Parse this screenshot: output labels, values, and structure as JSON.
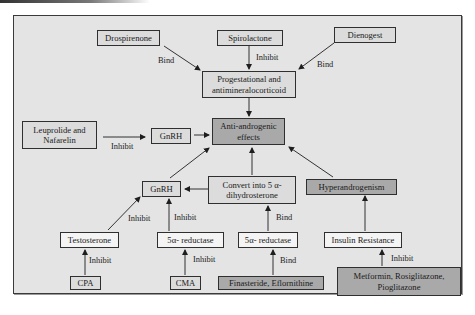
{
  "diagram": {
    "nodes": {
      "drospirenone": "Drospirenone",
      "spirolactone": "Spirolactone",
      "dienogest": "Dienogest",
      "progestational": "Progestational and antimineralocorticoid",
      "leuprolide": "Leuprolide and Nafarelin",
      "gnrh_top": "GnRH",
      "anti_androgenic": "Anti-androgenic effects",
      "gnrh_mid": "GnRH",
      "convert": "Convert into 5 α-dihydrosterone",
      "hyperandrogenism": "Hyperandrogenism",
      "testosterone": "Testosterone",
      "reductase_left": "5α- reductase",
      "reductase_right": "5α- reductase",
      "insulin_resistance": "Insulin Resistance",
      "cpa": "CPA",
      "cma": "CMA",
      "finasteride": "Finasteride, Eflornithine",
      "metformin": "Metformin, Rosiglitazone, Pioglitazone"
    },
    "edge_labels": {
      "drospirenone_bind": "Bind",
      "spirolactone_inhibit": "Inhibit",
      "dienogest_bind": "Bind",
      "leuprolide_inhibit": "Inhibit",
      "testosterone_inhibit": "Inhibit",
      "reductase_left_inhibit": "Inhibit",
      "reductase_right_bind": "Bind",
      "cpa_inhibit": "Inhibit",
      "cma_inhibit": "Inhibit",
      "finasteride_bind": "Bind",
      "metformin_inhibit": "Inhibit"
    },
    "edges": [
      {
        "from": "drospirenone",
        "to": "progestational",
        "label": "Bind"
      },
      {
        "from": "spirolactone",
        "to": "progestational",
        "label": "Inhibit"
      },
      {
        "from": "dienogest",
        "to": "progestational",
        "label": "Bind"
      },
      {
        "from": "progestational",
        "to": "anti_androgenic",
        "label": ""
      },
      {
        "from": "leuprolide",
        "to": "gnrh_top",
        "label": "Inhibit"
      },
      {
        "from": "gnrh_top",
        "to": "anti_androgenic",
        "label": ""
      },
      {
        "from": "gnrh_mid",
        "to": "anti_androgenic",
        "label": ""
      },
      {
        "from": "convert",
        "to": "anti_androgenic",
        "label": ""
      },
      {
        "from": "hyperandrogenism",
        "to": "anti_androgenic",
        "label": ""
      },
      {
        "from": "convert",
        "to": "gnrh_mid",
        "label": ""
      },
      {
        "from": "testosterone",
        "to": "gnrh_mid",
        "label": "Inhibit"
      },
      {
        "from": "reductase_left",
        "to": "gnrh_mid",
        "label": "Inhibit"
      },
      {
        "from": "reductase_right",
        "to": "convert",
        "label": "Bind"
      },
      {
        "from": "insulin_resistance",
        "to": "hyperandrogenism",
        "label": ""
      },
      {
        "from": "cpa",
        "to": "testosterone",
        "label": "Inhibit"
      },
      {
        "from": "cma",
        "to": "reductase_left",
        "label": "Inhibit"
      },
      {
        "from": "finasteride",
        "to": "reductase_right",
        "label": "Bind"
      },
      {
        "from": "metformin",
        "to": "insulin_resistance",
        "label": "Inhibit"
      }
    ],
    "colors": {
      "frame_bg": "#e4e4e4",
      "box_light": "#dcdcdc",
      "box_white": "#f4f4f4",
      "box_dark": "#a9a9a9",
      "line": "#1e1e1e"
    }
  }
}
